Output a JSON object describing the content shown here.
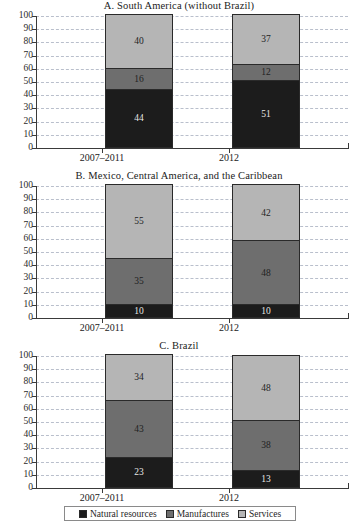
{
  "chart_data": {
    "type": "bar",
    "title": "",
    "subtype": "stacked-percentage",
    "orientation": "vertical",
    "grid": true,
    "legend_position": "bottom",
    "xlabel": "",
    "ylabel": "",
    "ylim": [
      0,
      100
    ],
    "ytick_labels": [
      "100",
      "90",
      "80",
      "70",
      "60",
      "50",
      "40",
      "30",
      "20",
      "10",
      "0"
    ],
    "ytick_values": [
      100,
      90,
      80,
      70,
      60,
      50,
      40,
      30,
      20,
      10,
      0
    ],
    "categories": [
      "2007–2011",
      "2012"
    ],
    "legend": [
      {
        "name": "Natural resources",
        "color": "#1c1c1c"
      },
      {
        "name": "Manufactures",
        "color": "#6e6e6e"
      },
      {
        "name": "Services",
        "color": "#b5b5b5"
      }
    ],
    "panels": [
      {
        "title": "A. South America (without Brazil)",
        "categories": [
          "2007–2011",
          "2012"
        ],
        "series": [
          {
            "name": "Natural resources",
            "values": [
              44,
              51
            ]
          },
          {
            "name": "Manufactures",
            "values": [
              16,
              12
            ]
          },
          {
            "name": "Services",
            "values": [
              40,
              37
            ]
          }
        ]
      },
      {
        "title": "B. Mexico, Central America, and the Caribbean",
        "categories": [
          "2007–2011",
          "2012"
        ],
        "series": [
          {
            "name": "Natural resources",
            "values": [
              10,
              10
            ]
          },
          {
            "name": "Manufactures",
            "values": [
              35,
              48
            ]
          },
          {
            "name": "Services",
            "values": [
              55,
              42
            ]
          }
        ]
      },
      {
        "title": "C. Brazil",
        "categories": [
          "2007–2011",
          "2012"
        ],
        "series": [
          {
            "name": "Natural resources",
            "values": [
              23,
              13
            ]
          },
          {
            "name": "Manufactures",
            "values": [
              43,
              38
            ]
          },
          {
            "name": "Services",
            "values": [
              34,
              48
            ]
          }
        ]
      }
    ]
  }
}
